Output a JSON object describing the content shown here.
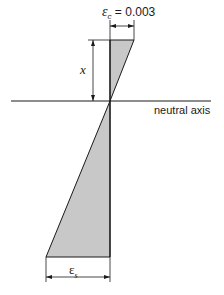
{
  "diagram": {
    "labels": {
      "concrete_strain_symbol": "ε",
      "concrete_strain_subscript": "c",
      "concrete_strain_value": " = 0.003",
      "depth_label": "x",
      "neutral_axis_label": "neutral axis",
      "steel_strain_symbol": "ε",
      "steel_strain_subscript": "s"
    },
    "colors": {
      "fill": "#c8c8c8",
      "stroke": "#1a1a1a"
    }
  }
}
